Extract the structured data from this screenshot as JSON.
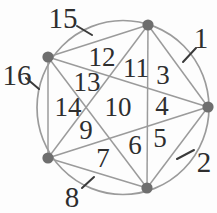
{
  "figure": {
    "kind": "circle-division-diagram",
    "region_count": 16,
    "vertex_count": 5,
    "chord_count": 10
  },
  "colors": {
    "background": "#fdfdfd",
    "line": "#9b9b9b",
    "dot_fill": "#6e6e6e",
    "label_text": "#2e2e2e",
    "tick": "#3a3a3a"
  },
  "geometry": {
    "circle": {
      "cx": 123,
      "cy": 107.5,
      "rx": 86,
      "ry": 87,
      "stroke_width": 1.7
    },
    "dot_radius": 5.6,
    "chord_width": 1.5,
    "tick_width": 2,
    "inner_label_size": 27,
    "outer_label_size": 29
  },
  "vertices": [
    {
      "id": "vertex-top",
      "x": 148,
      "y": 25
    },
    {
      "id": "vertex-upper-left",
      "x": 48,
      "y": 57
    },
    {
      "id": "vertex-right",
      "x": 208,
      "y": 107
    },
    {
      "id": "vertex-lower-left",
      "x": 48,
      "y": 158
    },
    {
      "id": "vertex-bottom",
      "x": 147,
      "y": 188
    }
  ],
  "edges": [
    [
      0,
      1
    ],
    [
      0,
      2
    ],
    [
      0,
      3
    ],
    [
      0,
      4
    ],
    [
      1,
      2
    ],
    [
      1,
      3
    ],
    [
      1,
      4
    ],
    [
      2,
      3
    ],
    [
      2,
      4
    ],
    [
      3,
      4
    ]
  ],
  "region_labels": [
    {
      "text": "1",
      "x": 201,
      "y": 38,
      "outside": true
    },
    {
      "text": "2",
      "x": 204,
      "y": 162,
      "outside": true
    },
    {
      "text": "3",
      "x": 163,
      "y": 75,
      "outside": false
    },
    {
      "text": "4",
      "x": 162,
      "y": 106,
      "outside": false
    },
    {
      "text": "5",
      "x": 160,
      "y": 138,
      "outside": false
    },
    {
      "text": "6",
      "x": 135,
      "y": 145,
      "outside": false
    },
    {
      "text": "7",
      "x": 103,
      "y": 158,
      "outside": false
    },
    {
      "text": "8",
      "x": 72,
      "y": 197,
      "outside": true
    },
    {
      "text": "9",
      "x": 86,
      "y": 130,
      "outside": false
    },
    {
      "text": "10",
      "x": 118,
      "y": 107,
      "outside": false
    },
    {
      "text": "11",
      "x": 136,
      "y": 68,
      "outside": false
    },
    {
      "text": "12",
      "x": 102,
      "y": 57,
      "outside": false
    },
    {
      "text": "13",
      "x": 87,
      "y": 82,
      "outside": false
    },
    {
      "text": "14",
      "x": 68,
      "y": 107,
      "outside": false
    },
    {
      "text": "15",
      "x": 63,
      "y": 18,
      "outside": true
    },
    {
      "text": "16",
      "x": 17,
      "y": 75,
      "outside": true
    }
  ],
  "leader_ticks": [
    {
      "for": "15",
      "x1": 77,
      "y1": 26,
      "x2": 92,
      "y2": 35
    },
    {
      "for": "16",
      "x1": 26,
      "y1": 78,
      "x2": 39,
      "y2": 89
    },
    {
      "for": "1",
      "x1": 183,
      "y1": 62,
      "x2": 196,
      "y2": 48
    },
    {
      "for": "2",
      "x1": 177,
      "y1": 159,
      "x2": 194,
      "y2": 150
    },
    {
      "for": "8",
      "x1": 82,
      "y1": 188,
      "x2": 94,
      "y2": 177
    }
  ]
}
